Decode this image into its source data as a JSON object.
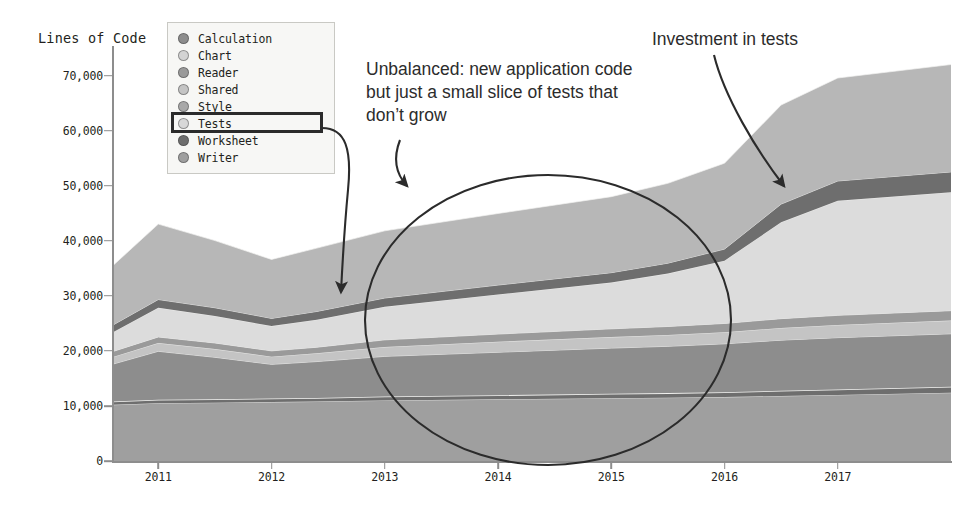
{
  "chart": {
    "axis_title": "Lines of Code",
    "ylabel": "Lines of Code",
    "xlabel": ""
  },
  "legend": {
    "highlighted_item": "Tests",
    "items": [
      {
        "label": "Calculation",
        "color": "#8d8d8d"
      },
      {
        "label": "Chart",
        "color": "#d3d3d3"
      },
      {
        "label": "Reader",
        "color": "#9a9a9a"
      },
      {
        "label": "Shared",
        "color": "#c4c4c4"
      },
      {
        "label": "Style",
        "color": "#a8a8a8"
      },
      {
        "label": "Tests",
        "color": "#d8d8d8"
      },
      {
        "label": "Worksheet",
        "color": "#6e6e6e"
      },
      {
        "label": "Writer",
        "color": "#9f9f9f"
      }
    ]
  },
  "annotations": [
    {
      "id": "unbalanced",
      "text": "Unbalanced: new application code but just a small slice of tests that don’t grow"
    },
    {
      "id": "investment",
      "text": "Investment in tests"
    }
  ],
  "ytick_labels": [
    "70,000",
    "60,000",
    "50,000",
    "40,000",
    "30,000",
    "20,000",
    "10,000",
    "0"
  ],
  "xtick_labels": [
    "2011",
    "2012",
    "2013",
    "2014",
    "2015",
    "2016",
    "2017"
  ],
  "chart_data": {
    "type": "area",
    "title": "",
    "subtitle": "",
    "xlabel": "",
    "ylabel": "Lines of Code",
    "ylim": [
      0,
      75000
    ],
    "xlim": [
      2010.6,
      2018.0
    ],
    "grid": false,
    "stacked": true,
    "legend_position": "top-left",
    "yticks": [
      0,
      10000,
      20000,
      30000,
      40000,
      50000,
      60000,
      70000
    ],
    "ytick_labels": [
      "0",
      "10,000",
      "20,000",
      "30,000",
      "40,000",
      "50,000",
      "60,000",
      "70,000"
    ],
    "xticks": [
      2011,
      2012,
      2013,
      2014,
      2015,
      2016,
      2017
    ],
    "xtick_labels": [
      "2011",
      "2012",
      "2013",
      "2014",
      "2015",
      "2016",
      "2017"
    ],
    "x": [
      2010.6,
      2011.0,
      2011.5,
      2012.0,
      2012.4,
      2013.0,
      2014.0,
      2015.0,
      2015.5,
      2016.0,
      2016.5,
      2017.0,
      2018.0
    ],
    "stack_order_bottom_to_top": [
      "Writer",
      "Worksheet",
      "Calculation",
      "Shared",
      "Reader",
      "Style",
      "Tests",
      "Chart"
    ],
    "series": [
      {
        "name": "Writer",
        "color": "#9f9f9f",
        "values": [
          10200,
          10500,
          10600,
          10700,
          10800,
          11000,
          11200,
          11400,
          11500,
          11600,
          11800,
          12000,
          12400
        ]
      },
      {
        "name": "Worksheet",
        "color": "#6e6e6e",
        "values": [
          600,
          620,
          630,
          650,
          660,
          700,
          750,
          800,
          830,
          880,
          950,
          1000,
          1100
        ]
      },
      {
        "name": "Calculation",
        "color": "#8d8d8d",
        "values": [
          6800,
          8800,
          7600,
          6200,
          6600,
          7300,
          7800,
          8300,
          8500,
          8800,
          9200,
          9400,
          9600
        ]
      },
      {
        "name": "Shared",
        "color": "#c4c4c4",
        "values": [
          1300,
          1500,
          1500,
          1400,
          1500,
          1700,
          1900,
          2000,
          2050,
          2100,
          2200,
          2300,
          2400
        ]
      },
      {
        "name": "Reader",
        "color": "#9a9a9a",
        "values": [
          1000,
          1100,
          1100,
          1050,
          1100,
          1300,
          1400,
          1500,
          1550,
          1600,
          1700,
          1750,
          1800
        ]
      },
      {
        "name": "Style",
        "color": "#dcdcdc",
        "values": [
          3500,
          5300,
          4900,
          4500,
          5000,
          6000,
          7200,
          8400,
          9600,
          11400,
          17500,
          20800,
          21500
        ]
      },
      {
        "name": "Tests",
        "color": "#6e6e6e",
        "values": [
          1300,
          1500,
          1500,
          1400,
          1500,
          1600,
          1700,
          1800,
          1900,
          2100,
          3300,
          3600,
          3700
        ]
      },
      {
        "name": "Chart",
        "color": "#b7b7b7",
        "values": [
          10800,
          13700,
          12200,
          10700,
          11500,
          12200,
          13000,
          13800,
          14500,
          15600,
          18000,
          18700,
          19500
        ]
      }
    ],
    "totals": [
      35500,
      43000,
      40000,
      36600,
      38660,
      41800,
      44950,
      48000,
      50430,
      54080,
      64650,
      69550,
      72000
    ],
    "annotations": [
      {
        "text": "Unbalanced: new application code but just a small slice of tests that don’t grow",
        "points_to": "ellipse-region-2013-to-2016"
      },
      {
        "text": "Investment in tests",
        "points_to": "tests-band-2016"
      },
      {
        "text": "Tests",
        "type": "legend-callout",
        "points_to": "tests-band-2012.8"
      }
    ],
    "highlight_ellipse": {
      "center_x": 2014.4,
      "center_y": 27000,
      "rx_years": 1.62,
      "ry_value": 25000
    }
  }
}
